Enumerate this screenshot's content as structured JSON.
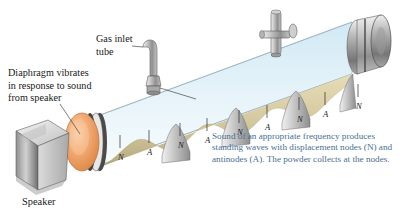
{
  "figure": {
    "labels": {
      "diaphragm": "Diaphragm vibrates\nin response to sound\nfrom speaker",
      "gas_inlet": "Gas inlet\ntube",
      "speaker": "Speaker"
    },
    "caption": "Sound of an appropriate frequency produces standing waves with displacement nodes (N) and antinodes (A). The powder collects at the nodes.",
    "colors": {
      "caption_text": "#4a6f96",
      "label_text": "#1a1a1a",
      "glass_tint": "#d7ecf5",
      "powder": "#d9cfa4",
      "powder_shade": "#b9ae80",
      "diaphragm": "#f0a06a",
      "metal_light": "#e2e2e2",
      "metal_dark": "#7d7d7d"
    },
    "markers": [
      {
        "type": "N",
        "x": 118,
        "y": 152
      },
      {
        "type": "A",
        "x": 147,
        "y": 147
      },
      {
        "type": "N",
        "x": 178,
        "y": 140
      },
      {
        "type": "A",
        "x": 205,
        "y": 135
      },
      {
        "type": "N",
        "x": 237,
        "y": 127
      },
      {
        "type": "A",
        "x": 265,
        "y": 122
      },
      {
        "type": "N",
        "x": 297,
        "y": 114
      },
      {
        "type": "A",
        "x": 323,
        "y": 109
      },
      {
        "type": "N",
        "x": 356,
        "y": 101
      }
    ]
  }
}
